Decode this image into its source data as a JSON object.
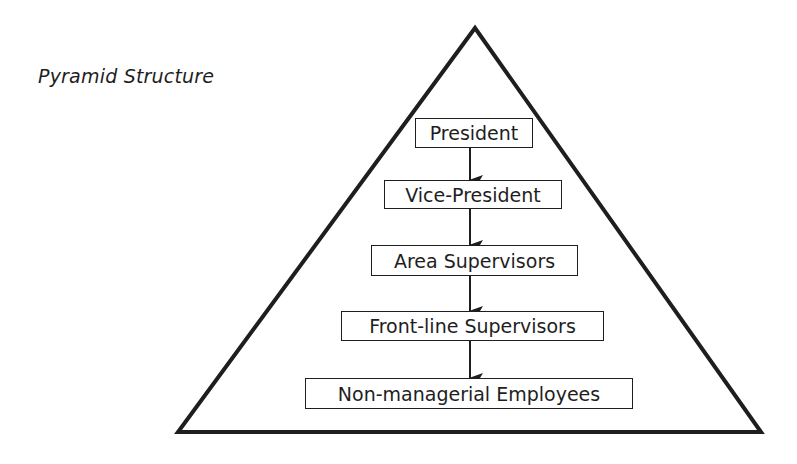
{
  "title": "Pyramid Structure",
  "diagram": {
    "type": "hierarchy-pyramid",
    "levels": [
      {
        "label": "President"
      },
      {
        "label": "Vice-President"
      },
      {
        "label": "Area Supervisors"
      },
      {
        "label": "Front-line Supervisors"
      },
      {
        "label": "Non-managerial Employees"
      }
    ],
    "edges": [
      {
        "from": "President",
        "to": "Vice-President"
      },
      {
        "from": "Vice-President",
        "to": "Area Supervisors"
      },
      {
        "from": "Area Supervisors",
        "to": "Front-line Supervisors"
      },
      {
        "from": "Front-line Supervisors",
        "to": "Non-managerial Employees"
      }
    ],
    "colors": {
      "stroke": "#1e1e1e",
      "background": "#ffffff"
    }
  }
}
